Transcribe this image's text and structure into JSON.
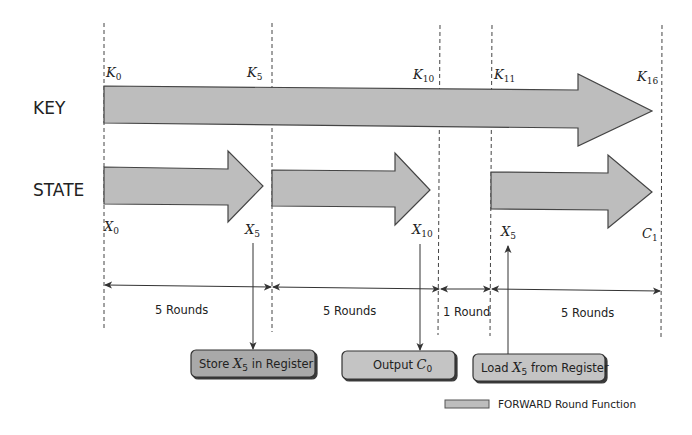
{
  "rows": {
    "key_label": "KEY",
    "state_label": "STATE"
  },
  "key_labels": [
    {
      "base": "K",
      "sub": "0"
    },
    {
      "base": "K",
      "sub": "5"
    },
    {
      "base": "K",
      "sub": "10"
    },
    {
      "base": "K",
      "sub": "11"
    },
    {
      "base": "K",
      "sub": "16"
    }
  ],
  "state_labels": [
    {
      "base": "X",
      "sub": "0"
    },
    {
      "base": "X",
      "sub": "5"
    },
    {
      "base": "X",
      "sub": "10"
    },
    {
      "base": "X",
      "sub": "5"
    },
    {
      "base": "C",
      "sub": "1"
    }
  ],
  "intervals": [
    {
      "label": "5 Rounds"
    },
    {
      "label": "5 Rounds"
    },
    {
      "label": "1 Round"
    },
    {
      "label": "5 Rounds"
    }
  ],
  "boxes": {
    "store": {
      "prefix": "Store ",
      "var": "X",
      "sub": "5",
      "suffix": " in Register"
    },
    "output": {
      "prefix": "Output ",
      "var": "C",
      "sub": "0",
      "suffix": ""
    },
    "load": {
      "prefix": "Load ",
      "var": "X",
      "sub": "5",
      "suffix": " from Register"
    }
  },
  "legend": {
    "label": "FORWARD Round Function"
  },
  "colors": {
    "arrow_fill": "#bdbdbd",
    "register_box_store": "#a9a9a9",
    "register_box_other": "#c4c4c4",
    "outline": "#444444"
  }
}
